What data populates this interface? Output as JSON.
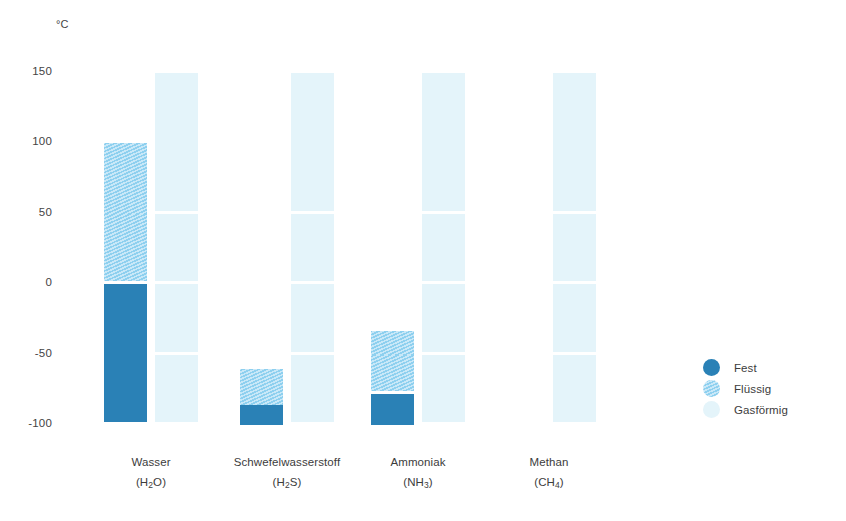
{
  "chart_data": {
    "type": "bar",
    "title": "",
    "subtitle": "",
    "xlabel": "",
    "ylabel": "°C",
    "unit_label": "°C",
    "ylim": [
      -100,
      150
    ],
    "ytick_values": [
      150,
      100,
      50,
      0,
      -50,
      -100
    ],
    "ytick_labels": [
      "150",
      "100",
      "50",
      "0",
      "-50",
      "-100"
    ],
    "grid": false,
    "legend_position": "right",
    "segment_gap_degrees": 50,
    "note": "Aggregatzustaende von vier Stoffen in Abhaengigkeit der Temperatur; jede Substanz besitzt eine Zustandssaeule (fest/fluessig) sowie rechts daneben eine separate Gas-Saeule.",
    "categories": [
      "Wasser",
      "Schwefelwasserstoff",
      "Ammoniak",
      "Methan"
    ],
    "formulas": [
      "(H2O)",
      "(H2S)",
      "(NH3)",
      "(CH4)"
    ],
    "legend": [
      {
        "key": "fest",
        "label": "Fest",
        "color": "#2a81b6"
      },
      {
        "key": "fluessig",
        "label": "Flüssig",
        "color": "#8ed0ef"
      },
      {
        "key": "gas",
        "label": "Gasförmig",
        "color": "#e4f4fa"
      }
    ],
    "colors": {
      "fest": "#2a81b6",
      "fluessig": "#8ed0ef",
      "fluessig_hatch": "#c9e8f8",
      "gas": "#e4f4fa",
      "text": "#3c3c3c",
      "background": "#ffffff"
    },
    "series": [
      {
        "name": "Fest",
        "key": "fest",
        "values": [
          {
            "category": "Wasser",
            "from": -100,
            "to": 0
          },
          {
            "category": "Schwefelwasserstoff",
            "from": -100,
            "to": -86
          },
          {
            "category": "Ammoniak",
            "from": -100,
            "to": -78
          },
          {
            "category": "Methan",
            "from": null,
            "to": null
          }
        ]
      },
      {
        "name": "Flüssig",
        "key": "fluessig",
        "values": [
          {
            "category": "Wasser",
            "from": 0,
            "to": 100
          },
          {
            "category": "Schwefelwasserstoff",
            "from": -86,
            "to": -60
          },
          {
            "category": "Ammoniak",
            "from": -78,
            "to": -33
          },
          {
            "category": "Methan",
            "from": null,
            "to": null
          }
        ]
      },
      {
        "name": "Gasförmig",
        "key": "gas",
        "values": [
          {
            "category": "Wasser",
            "from": -100,
            "to": 150
          },
          {
            "category": "Schwefelwasserstoff",
            "from": -100,
            "to": 150
          },
          {
            "category": "Ammoniak",
            "from": -100,
            "to": 150
          },
          {
            "category": "Methan",
            "from": -100,
            "to": 150
          }
        ]
      }
    ]
  },
  "axis": {
    "unit": "°C",
    "ticks": [
      {
        "label": "150",
        "value": 150
      },
      {
        "label": "100",
        "value": 100
      },
      {
        "label": "50",
        "value": 50
      },
      {
        "label": "0",
        "value": 0
      },
      {
        "label": "-50",
        "value": -50
      },
      {
        "label": "-100",
        "value": -100
      }
    ]
  },
  "x_categories": [
    {
      "name": "Wasser",
      "formula_prefix": "(H",
      "formula_sub": "2",
      "formula_suffix": "O)"
    },
    {
      "name": "Schwefelwasserstoff",
      "formula_prefix": "(H",
      "formula_sub": "2",
      "formula_suffix": "S)"
    },
    {
      "name": "Ammoniak",
      "formula_prefix": "(NH",
      "formula_sub": "3",
      "formula_suffix": ")"
    },
    {
      "name": "Methan",
      "formula_prefix": "(CH",
      "formula_sub": "4",
      "formula_suffix": ")"
    }
  ],
  "legend": {
    "items": [
      {
        "label": "Fest"
      },
      {
        "label": "Flüssig"
      },
      {
        "label": "Gasförmig"
      }
    ]
  }
}
